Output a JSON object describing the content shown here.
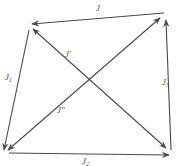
{
  "diagram": {
    "type": "directed-quadrilateral",
    "colors": {
      "stroke": "#4a4a4a",
      "label": "#555555",
      "background": "#ffffff"
    },
    "nodes": [
      {
        "id": "top-left",
        "x": 31,
        "y": 27
      },
      {
        "id": "top-right",
        "x": 165,
        "y": 14
      },
      {
        "id": "bottom-left",
        "x": 5,
        "y": 152
      },
      {
        "id": "bottom-right",
        "x": 170,
        "y": 154
      }
    ],
    "edges": [
      {
        "id": "J",
        "from": "top-right",
        "to": "top-left",
        "label": "J",
        "sub": "",
        "arrow": "end"
      },
      {
        "id": "J1",
        "from": "top-left",
        "to": "bottom-left",
        "label": "J",
        "sub": "1",
        "arrow": "end"
      },
      {
        "id": "J2",
        "from": "bottom-left",
        "to": "bottom-right",
        "label": "J",
        "sub": "2",
        "arrow": "end"
      },
      {
        "id": "J3",
        "from": "bottom-right",
        "to": "top-right",
        "label": "J",
        "sub": "3",
        "arrow": "end"
      },
      {
        "id": "Jprime",
        "from": "top-left",
        "to": "bottom-right",
        "label": "J′",
        "sub": "",
        "arrow": "both"
      },
      {
        "id": "Jdoubleprime",
        "from": "bottom-left",
        "to": "top-right",
        "label": "J″",
        "sub": "",
        "arrow": "both"
      }
    ],
    "labels": {
      "top": "J",
      "left": "J",
      "left_sub": "1",
      "bottom": "J",
      "bottom_sub": "2",
      "right": "J",
      "right_sub": "3",
      "diag1": "J′",
      "diag2": "J″"
    }
  }
}
